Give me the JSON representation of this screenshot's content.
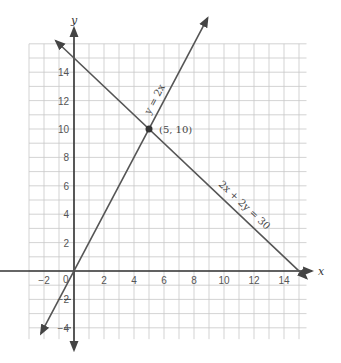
{
  "chart_data": {
    "type": "line",
    "title": "",
    "xlabel": "x",
    "ylabel": "y",
    "xlim": [
      -3,
      15.5
    ],
    "ylim": [
      -4.8,
      16
    ],
    "grid": true,
    "x_ticks": [
      -2,
      0,
      2,
      4,
      6,
      8,
      10,
      12,
      14
    ],
    "y_ticks": [
      -4,
      -2,
      2,
      4,
      6,
      8,
      10,
      12,
      14
    ],
    "series": [
      {
        "name": "y = 2x",
        "equation": "y = 2x",
        "points": [
          [
            -2.2,
            -4.4
          ],
          [
            8.9,
            17.8
          ]
        ]
      },
      {
        "name": "2x + 2y = 30",
        "equation": "2x + 2y = 30",
        "points": [
          [
            -1.2,
            16.2
          ],
          [
            15.5,
            -0.5
          ]
        ]
      }
    ],
    "annotations": [
      {
        "text": "(5, 10)",
        "x": 5,
        "y": 10,
        "kind": "intersection-point"
      },
      {
        "text": "y = 2x",
        "kind": "line-label"
      },
      {
        "text": "2x + 2y = 30",
        "kind": "line-label"
      }
    ]
  },
  "labels": {
    "x_axis": "x",
    "y_axis": "y",
    "point": "(5, 10)",
    "line1": "y = 2x",
    "line2": "2x + 2y = 30",
    "origin": "0"
  }
}
